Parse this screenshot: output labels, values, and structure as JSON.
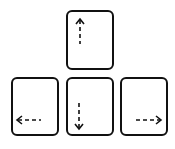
{
  "keys": [
    {
      "id": "up",
      "label": "up-arrow-key",
      "direction": "up"
    },
    {
      "id": "left",
      "label": "left-arrow-key",
      "direction": "left"
    },
    {
      "id": "down",
      "label": "down-arrow-key",
      "direction": "down"
    },
    {
      "id": "right",
      "label": "right-arrow-key",
      "direction": "right"
    }
  ],
  "colors": {
    "stroke": "#111111",
    "background": "#ffffff"
  }
}
